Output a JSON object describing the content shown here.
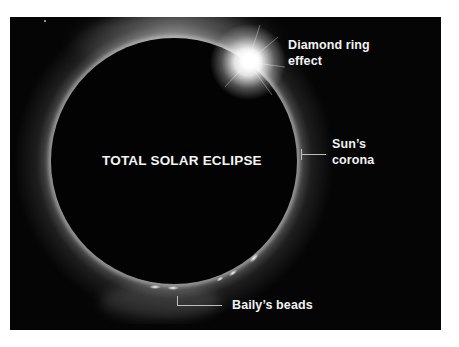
{
  "figure": {
    "title": "TOTAL SOLAR ECLIPSE",
    "background_color": "#050505",
    "moon_color": "#030303",
    "corona_color": "#ffffff",
    "labels": {
      "diamond_ring": {
        "line1": "Diamond ring",
        "line2": "effect"
      },
      "corona": {
        "line1": "Sun’s",
        "line2": "corona"
      },
      "bailys_beads": {
        "line1": "Baily’s beads"
      }
    }
  }
}
